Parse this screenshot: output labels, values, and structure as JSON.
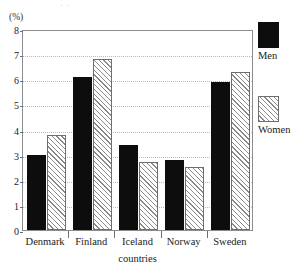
{
  "figure": {
    "unit_label": "(%)",
    "top_cut_text": "· ·"
  },
  "legend": {
    "position": "right",
    "items": [
      {
        "label": "Men",
        "swatch": "solid-black-swatch"
      },
      {
        "label": "Women",
        "swatch": "hatched-swatch"
      }
    ]
  },
  "chart_data": {
    "type": "bar",
    "title": "",
    "subtitle": "",
    "xlabel": "countries",
    "ylabel": "(%)",
    "categories": [
      "Denmark",
      "Finland",
      "Iceland",
      "Norway",
      "Sweden"
    ],
    "series": [
      {
        "name": "Men",
        "values": [
          3.0,
          6.1,
          3.4,
          2.8,
          5.9
        ]
      },
      {
        "name": "Women",
        "values": [
          3.8,
          6.8,
          2.7,
          2.5,
          6.3
        ]
      }
    ],
    "ylim": [
      0,
      8
    ],
    "ytick_labels": [
      "0",
      "1",
      "2",
      "3",
      "4",
      "5",
      "6",
      "7",
      "8"
    ],
    "ytick_values": [
      0,
      1,
      2,
      3,
      4,
      5,
      6,
      7,
      8
    ],
    "grid": "horizontal-dotted",
    "legend_position": "right",
    "colors": {
      "men": "#0d0d0d",
      "women": "#ffffff",
      "women_hatch": "#8a8a8a",
      "axis": "#8d8d8d",
      "grid": "#b9b9b9"
    }
  }
}
